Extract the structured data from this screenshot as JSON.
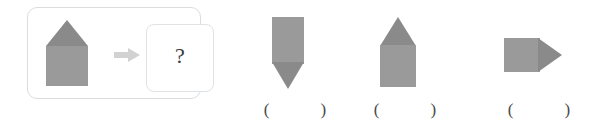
{
  "colors": {
    "shape_body": "#9a9a9a",
    "shape_accent": "#808080",
    "panel_border": "#d9dde0",
    "inner_border": "#dfe3e6",
    "arrow": "#d0d0d0",
    "text": "#3a3a3a",
    "background": "#ffffff"
  },
  "question": {
    "panel_name": "question-panel",
    "stimulus": {
      "icon": "house-shape-icon",
      "description": "square with upward triangle on top"
    },
    "arrow": {
      "icon": "right-arrow-icon",
      "label": "→"
    },
    "answer_placeholder": "?"
  },
  "options": [
    {
      "id": "a",
      "icon": "square-with-downward-triangle-icon",
      "description": "square with downward-pointing triangle below",
      "paren_left": "(",
      "paren_right": ")",
      "paren": "(            )"
    },
    {
      "id": "b",
      "icon": "house-shape-icon",
      "description": "square with upward-pointing triangle on top",
      "paren_left": "(",
      "paren_right": ")",
      "paren": "(            )"
    },
    {
      "id": "c",
      "icon": "square-with-rightward-triangle-icon",
      "description": "square with right-pointing triangle",
      "paren_left": "(",
      "paren_right": ")",
      "paren": "(            )"
    }
  ]
}
